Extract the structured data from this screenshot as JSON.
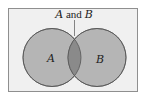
{
  "diagram": {
    "type": "venn",
    "title_label": {
      "part1": "A",
      "part2": " and ",
      "part3": "B"
    },
    "sets": [
      {
        "label": "A",
        "cx": 52,
        "cy": 57.5,
        "r": 29
      },
      {
        "label": "B",
        "cx": 97,
        "cy": 57.5,
        "r": 29
      }
    ],
    "colors": {
      "background": "#f0f0f0",
      "border": "#8f8f8f",
      "circle_fill": "#b5b5b5",
      "overlap_fill": "#8a8a8a",
      "stroke": "#555555"
    }
  }
}
